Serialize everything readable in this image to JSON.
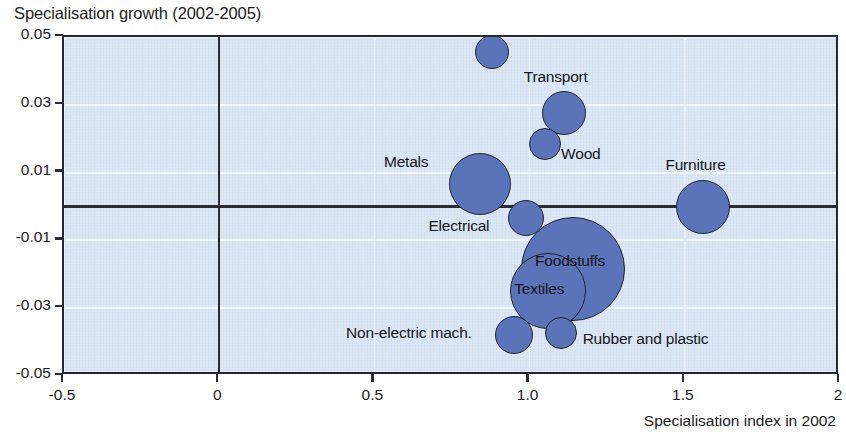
{
  "chart_data": {
    "type": "scatter",
    "title": "Specialisation growth (2002-2005)",
    "xlabel": "Specialisation index in 2002",
    "ylabel": "",
    "xlim": [
      -0.5,
      2.0
    ],
    "ylim": [
      -0.05,
      0.05
    ],
    "grid": true,
    "legend": "none",
    "xticks": [
      "-0.5",
      "0",
      "0.5",
      "1.0",
      "1.5",
      "2"
    ],
    "xtick_values": [
      -0.5,
      0,
      0.5,
      1.0,
      1.5,
      2.0
    ],
    "yticks": [
      "0.05",
      "0.03",
      "0.01",
      "-0.01",
      "-0.03",
      "-0.05"
    ],
    "ytick_values": [
      0.05,
      0.03,
      0.01,
      -0.01,
      -0.03,
      -0.05
    ],
    "bubble_color": "#5b73b8",
    "plot_background": "#dae5f4",
    "points": [
      {
        "label": "Paper",
        "x": 0.88,
        "y": 0.0455,
        "size": 17,
        "label_dx": -46,
        "label_dy": -26
      },
      {
        "label": "Transport",
        "x": 1.11,
        "y": 0.0275,
        "size": 22,
        "label_dx": -40,
        "label_dy": -36
      },
      {
        "label": "Wood",
        "x": 1.05,
        "y": 0.0185,
        "size": 16,
        "label_dx": 16,
        "label_dy": 10
      },
      {
        "label": "Metals",
        "x": 0.84,
        "y": 0.0065,
        "size": 31,
        "label_dx": -96,
        "label_dy": -22
      },
      {
        "label": "Furniture",
        "x": 1.56,
        "y": 0.0,
        "size": 27,
        "label_dx": -38,
        "label_dy": -42
      },
      {
        "label": "Electrical",
        "x": 0.99,
        "y": -0.0035,
        "size": 18,
        "label_dx": -98,
        "label_dy": 8
      },
      {
        "label": "Foodstuffs",
        "x": 1.14,
        "y": -0.0185,
        "size": 52,
        "label_dx": -38,
        "label_dy": -8
      },
      {
        "label": "Textiles",
        "x": 1.06,
        "y": -0.0248,
        "size": 38,
        "label_dx": -34,
        "label_dy": -2
      },
      {
        "label": "Non-electric mach.",
        "x": 0.95,
        "y": -0.038,
        "size": 19,
        "label_dx": -168,
        "label_dy": -2
      },
      {
        "label": "Rubber and plastic",
        "x": 1.1,
        "y": -0.0372,
        "size": 16,
        "label_dx": 22,
        "label_dy": 6
      }
    ]
  }
}
